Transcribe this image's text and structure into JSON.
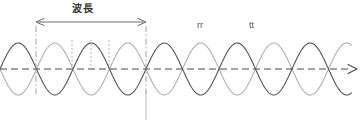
{
  "figure": {
    "title_label": "波長",
    "labels": [
      {
        "id": "wavelength",
        "text": "波長",
        "x": 72,
        "y": 4
      },
      {
        "id": "rr",
        "text": "rr",
        "x": 197,
        "y": 21
      },
      {
        "id": "tt",
        "text": "tt",
        "x": 249,
        "y": 21
      }
    ]
  },
  "chart_data": {
    "type": "line",
    "title": "波長",
    "xlabel": "",
    "ylabel": "",
    "annotations": [
      "波長",
      "rr",
      "tt"
    ],
    "legend": [],
    "grid": false,
    "axis": {
      "baseline_y": 69,
      "x_start": 0,
      "x_end": 355,
      "style": "dashed",
      "arrow_end": true
    },
    "series": [
      {
        "name": "wave-dark",
        "color": "#555555",
        "amplitude": 26,
        "period": 73,
        "phase_deg": 0,
        "x_start": 0,
        "x_end": 352
      },
      {
        "name": "wave-light",
        "color": "#b0b0b0",
        "amplitude": 26,
        "period": 73,
        "phase_deg": 180,
        "x_start": 0,
        "x_end": 352
      }
    ],
    "dimension": {
      "label": "波長",
      "x1": 36,
      "x2": 146,
      "y": 22,
      "value_px": 110,
      "double_headed": true
    },
    "guides": [
      {
        "x": 36,
        "style": "dashdot",
        "y1": 26,
        "y2": 95
      },
      {
        "x": 146,
        "style": "dashdot",
        "y1": 26,
        "y2": 95
      },
      {
        "x": 72,
        "style": "dotted",
        "y1": 40,
        "y2": 72
      },
      {
        "x": 91,
        "style": "dotted",
        "y1": 40,
        "y2": 72
      },
      {
        "x": 109,
        "style": "dotted",
        "y1": 40,
        "y2": 72
      }
    ],
    "marker_line": {
      "x": 146,
      "y1": 90,
      "y2": 120,
      "color": "#bbbbbb"
    }
  },
  "colors": {
    "wave_dark": "#555555",
    "wave_light": "#b0b0b0",
    "axis": "#4a4a4a",
    "guide": "#9a9a9a",
    "dimension": "#6a6a6a",
    "text": "#3a3a3a",
    "background": "#ffffff"
  }
}
